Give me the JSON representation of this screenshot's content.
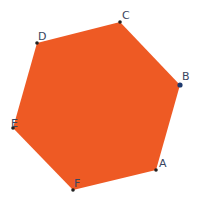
{
  "diagram": {
    "type": "regular-hexagon",
    "fill_color": "#EE5A24",
    "vertex_color": "#222222",
    "highlight_vertex_color": "#1f3a6e",
    "label_color": "#3a4560",
    "vertices": [
      {
        "label": "A",
        "x": 156,
        "y": 170,
        "lx": 159,
        "ly": 167
      },
      {
        "label": "B",
        "x": 180,
        "y": 85,
        "lx": 182,
        "ly": 80
      },
      {
        "label": "C",
        "x": 120,
        "y": 22,
        "lx": 122,
        "ly": 19
      },
      {
        "label": "D",
        "x": 37,
        "y": 43,
        "lx": 38,
        "ly": 40
      },
      {
        "label": "E",
        "x": 13,
        "y": 128,
        "lx": 11,
        "ly": 127
      },
      {
        "label": "F",
        "x": 73,
        "y": 190,
        "lx": 74,
        "ly": 187
      }
    ]
  }
}
